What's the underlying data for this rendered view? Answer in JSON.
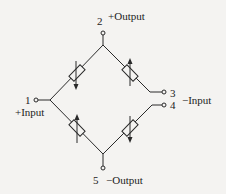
{
  "diagram": {
    "colors": {
      "line": "#2a2a2a",
      "background": "#f4f3f1",
      "text": "#222222"
    },
    "terminals": [
      {
        "id": "1",
        "number": "1",
        "label": "+Input"
      },
      {
        "id": "2",
        "number": "2",
        "label": "+Output"
      },
      {
        "id": "3",
        "number": "3",
        "label": ""
      },
      {
        "id": "4",
        "number": "4",
        "label": "−Input"
      },
      {
        "id": "5",
        "number": "5",
        "label": "−Output"
      }
    ],
    "elements": [
      {
        "id": "R1",
        "type": "variable-resistor",
        "position": "upper-left",
        "arrow": "down"
      },
      {
        "id": "R2",
        "type": "variable-resistor",
        "position": "upper-right",
        "arrow": "up"
      },
      {
        "id": "R3",
        "type": "variable-resistor",
        "position": "lower-left",
        "arrow": "up"
      },
      {
        "id": "R4",
        "type": "variable-resistor",
        "position": "lower-right",
        "arrow": "down"
      }
    ],
    "labels": {
      "t1_num": "1",
      "t1_name": "+Input",
      "t2_num": "2",
      "t2_name": "+Output",
      "t3_num": "3",
      "t4_num": "4",
      "t34_name": "−Input",
      "t5_num": "5",
      "t5_name": "−Output"
    }
  }
}
